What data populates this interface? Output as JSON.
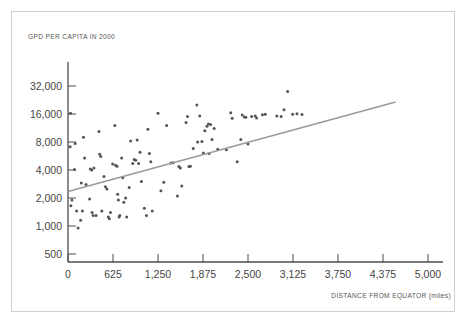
{
  "figure": {
    "name": "gdp-vs-distance-from-equator-scatter",
    "background_color": "#ffffff",
    "frame_color": "#cfcfcf",
    "axis_color": "#4d4d4d",
    "point_color": "#555555",
    "trendline_color": "#9a9a9a"
  },
  "chart_data": {
    "type": "scatter",
    "title": "",
    "ylabel": "GPD PER CAPITA IN 2000",
    "xlabel": "DISTANCE FROM EQUATOR (miles)",
    "grid": false,
    "legend": "none",
    "xlim": [
      0,
      5000
    ],
    "ylim": [
      500,
      64000
    ],
    "yscale": "log2",
    "xticks": [
      0,
      625,
      1250,
      1875,
      2500,
      3125,
      3750,
      4375,
      5000
    ],
    "xticklabels": [
      "0",
      "625",
      "1,250",
      "1,875",
      "2,500",
      "3,125",
      "3,750",
      "4,375",
      "5,000"
    ],
    "yticks": [
      500,
      1000,
      2000,
      4000,
      8000,
      16000,
      32000
    ],
    "yticklabels": [
      "500",
      "1,000",
      "2,000",
      "4,000",
      "8,000",
      "16,000",
      "32,000"
    ],
    "trendline": {
      "type": "linear-on-log2-y",
      "x_start": 0,
      "y_start": 2350,
      "x_end": 4550,
      "y_end": 21500
    },
    "points": [
      [
        30,
        7100
      ],
      [
        35,
        16300
      ],
      [
        40,
        1650
      ],
      [
        55,
        1900
      ],
      [
        90,
        4050
      ],
      [
        100,
        7700
      ],
      [
        120,
        1450
      ],
      [
        140,
        950
      ],
      [
        175,
        1150
      ],
      [
        185,
        2900
      ],
      [
        200,
        1450
      ],
      [
        215,
        9000
      ],
      [
        230,
        5400
      ],
      [
        250,
        2800
      ],
      [
        300,
        1950
      ],
      [
        310,
        4100
      ],
      [
        330,
        4000
      ],
      [
        335,
        1400
      ],
      [
        350,
        1300
      ],
      [
        360,
        4200
      ],
      [
        390,
        1300
      ],
      [
        430,
        10400
      ],
      [
        440,
        5900
      ],
      [
        455,
        5600
      ],
      [
        470,
        1450
      ],
      [
        500,
        3400
      ],
      [
        520,
        2650
      ],
      [
        540,
        2500
      ],
      [
        560,
        1250
      ],
      [
        575,
        1200
      ],
      [
        590,
        1400
      ],
      [
        620,
        4650
      ],
      [
        650,
        12000
      ],
      [
        660,
        4500
      ],
      [
        680,
        4400
      ],
      [
        690,
        2200
      ],
      [
        700,
        1900
      ],
      [
        710,
        1250
      ],
      [
        720,
        1300
      ],
      [
        745,
        5400
      ],
      [
        760,
        3300
      ],
      [
        775,
        1800
      ],
      [
        800,
        2000
      ],
      [
        815,
        1250
      ],
      [
        850,
        2600
      ],
      [
        870,
        8200
      ],
      [
        900,
        4700
      ],
      [
        920,
        5200
      ],
      [
        940,
        5100
      ],
      [
        960,
        8400
      ],
      [
        980,
        4700
      ],
      [
        1000,
        6200
      ],
      [
        1020,
        3000
      ],
      [
        1060,
        1550
      ],
      [
        1090,
        1300
      ],
      [
        1110,
        11000
      ],
      [
        1130,
        6000
      ],
      [
        1150,
        4900
      ],
      [
        1170,
        1450
      ],
      [
        1250,
        16300
      ],
      [
        1290,
        2400
      ],
      [
        1330,
        2950
      ],
      [
        1370,
        12000
      ],
      [
        1430,
        4750
      ],
      [
        1460,
        4800
      ],
      [
        1520,
        2100
      ],
      [
        1540,
        4350
      ],
      [
        1560,
        4200
      ],
      [
        1580,
        2700
      ],
      [
        1640,
        13000
      ],
      [
        1660,
        15000
      ],
      [
        1680,
        4350
      ],
      [
        1700,
        4400
      ],
      [
        1740,
        6800
      ],
      [
        1790,
        20000
      ],
      [
        1800,
        8000
      ],
      [
        1830,
        15200
      ],
      [
        1860,
        8100
      ],
      [
        1880,
        6100
      ],
      [
        1900,
        10600
      ],
      [
        1930,
        11800
      ],
      [
        1950,
        12500
      ],
      [
        1960,
        6000
      ],
      [
        1980,
        12300
      ],
      [
        2000,
        8500
      ],
      [
        2030,
        11200
      ],
      [
        2080,
        6700
      ],
      [
        2200,
        6600
      ],
      [
        2260,
        16500
      ],
      [
        2280,
        14400
      ],
      [
        2350,
        4900
      ],
      [
        2400,
        8500
      ],
      [
        2420,
        15600
      ],
      [
        2450,
        14900
      ],
      [
        2470,
        14800
      ],
      [
        2500,
        7600
      ],
      [
        2550,
        15000
      ],
      [
        2600,
        15200
      ],
      [
        2620,
        14500
      ],
      [
        2700,
        15700
      ],
      [
        2740,
        15900
      ],
      [
        2900,
        15200
      ],
      [
        2960,
        15000
      ],
      [
        3000,
        17800
      ],
      [
        3050,
        28000
      ],
      [
        3120,
        15900
      ],
      [
        3180,
        16100
      ],
      [
        3250,
        15800
      ]
    ]
  }
}
